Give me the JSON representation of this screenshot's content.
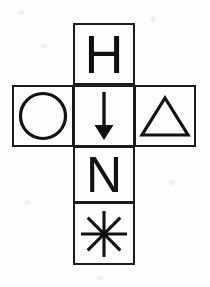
{
  "figure": {
    "background_color": "#fefefe",
    "line_color": "#1c1c1c",
    "cells": [
      {
        "position": "top",
        "symbol_name": "letter-h",
        "symbol": "H"
      },
      {
        "position": "left",
        "symbol_name": "circle",
        "symbol": "O"
      },
      {
        "position": "center",
        "symbol_name": "down-arrow",
        "symbol": "↓"
      },
      {
        "position": "right",
        "symbol_name": "triangle",
        "symbol": "△"
      },
      {
        "position": "lower",
        "symbol_name": "letter-n",
        "symbol": "N"
      },
      {
        "position": "bottom",
        "symbol_name": "asterisk",
        "symbol": "✳"
      }
    ]
  }
}
